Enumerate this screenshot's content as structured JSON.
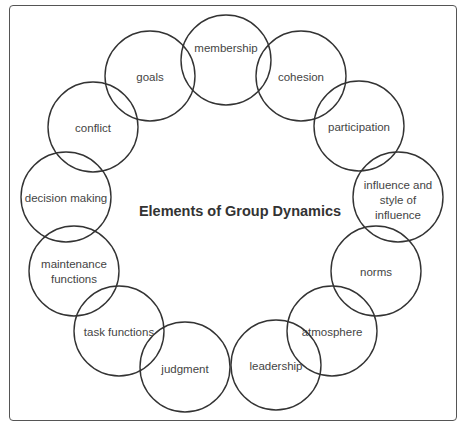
{
  "diagram": {
    "title": "Elements of Group Dynamics",
    "nodes": [
      {
        "id": "membership",
        "lines": [
          "membership"
        ],
        "cx": 226,
        "cy": 60,
        "ty": 48
      },
      {
        "id": "cohesion",
        "lines": [
          "cohesion"
        ],
        "cx": 301,
        "cy": 76,
        "ty": 77
      },
      {
        "id": "participation",
        "lines": [
          "participation"
        ],
        "cx": 359,
        "cy": 126,
        "ty": 127
      },
      {
        "id": "influence",
        "lines": [
          "influence and",
          "style of",
          "influence"
        ],
        "cx": 398,
        "cy": 197,
        "ty": 185
      },
      {
        "id": "norms",
        "lines": [
          "norms"
        ],
        "cx": 376,
        "cy": 271,
        "ty": 272
      },
      {
        "id": "atmosphere",
        "lines": [
          "atmosphere"
        ],
        "cx": 332,
        "cy": 331,
        "ty": 332
      },
      {
        "id": "leadership",
        "lines": [
          "leadership"
        ],
        "cx": 276,
        "cy": 365,
        "ty": 366
      },
      {
        "id": "judgment",
        "lines": [
          "judgment"
        ],
        "cx": 185,
        "cy": 367,
        "ty": 369
      },
      {
        "id": "task-functions",
        "lines": [
          "task functions"
        ],
        "cx": 119,
        "cy": 331,
        "ty": 332
      },
      {
        "id": "maintenance-functions",
        "lines": [
          "maintenance",
          "functions"
        ],
        "cx": 74,
        "cy": 271,
        "ty": 264
      },
      {
        "id": "decision-making",
        "lines": [
          "decision making"
        ],
        "cx": 66,
        "cy": 197,
        "ty": 198
      },
      {
        "id": "conflict",
        "lines": [
          "conflict"
        ],
        "cx": 93,
        "cy": 127,
        "ty": 128
      },
      {
        "id": "goals",
        "lines": [
          "goals"
        ],
        "cx": 150,
        "cy": 76,
        "ty": 77
      }
    ],
    "radius": 45,
    "colors": {
      "stroke": "#333333",
      "text": "#444444",
      "frame": "#555555"
    }
  }
}
